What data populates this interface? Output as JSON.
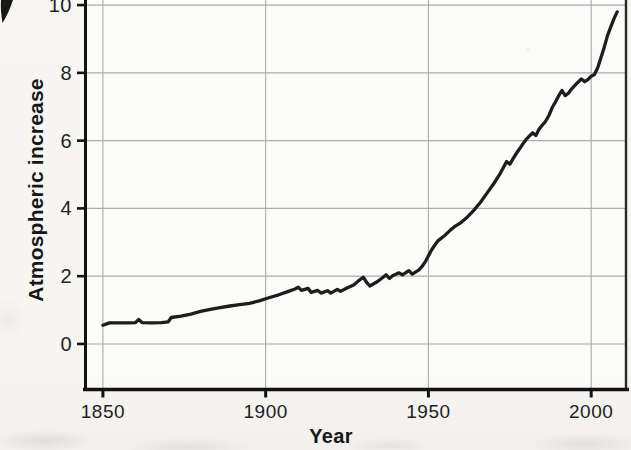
{
  "figure": {
    "background": "#f6f5f2",
    "line_color": "#1d1d1d",
    "grid_color": "#ababab",
    "axis_color": "#131313"
  },
  "chart_data": {
    "type": "line",
    "title": "",
    "xlabel": "Year",
    "ylabel": "Atmospheric increase",
    "x_ticks": [
      1850,
      1900,
      1950,
      2000
    ],
    "y_ticks": [
      0,
      2,
      4,
      6,
      8,
      10
    ],
    "xlim": [
      1844.5,
      2011
    ],
    "ylim": [
      -1.33,
      10.15
    ],
    "grid": true,
    "legend": "none",
    "series": [
      {
        "name": "atmospheric-increase",
        "points": [
          [
            1850,
            0.55
          ],
          [
            1852,
            0.62
          ],
          [
            1855,
            0.62
          ],
          [
            1858,
            0.62
          ],
          [
            1860,
            0.63
          ],
          [
            1861,
            0.72
          ],
          [
            1862,
            0.63
          ],
          [
            1865,
            0.62
          ],
          [
            1868,
            0.63
          ],
          [
            1870,
            0.65
          ],
          [
            1871,
            0.78
          ],
          [
            1874,
            0.82
          ],
          [
            1877,
            0.88
          ],
          [
            1880,
            0.96
          ],
          [
            1883,
            1.02
          ],
          [
            1886,
            1.07
          ],
          [
            1889,
            1.12
          ],
          [
            1892,
            1.16
          ],
          [
            1895,
            1.2
          ],
          [
            1898,
            1.27
          ],
          [
            1901,
            1.36
          ],
          [
            1904,
            1.45
          ],
          [
            1907,
            1.55
          ],
          [
            1909,
            1.62
          ],
          [
            1910,
            1.67
          ],
          [
            1911,
            1.58
          ],
          [
            1913,
            1.64
          ],
          [
            1914,
            1.52
          ],
          [
            1916,
            1.58
          ],
          [
            1917,
            1.5
          ],
          [
            1919,
            1.57
          ],
          [
            1920,
            1.5
          ],
          [
            1922,
            1.61
          ],
          [
            1923,
            1.55
          ],
          [
            1925,
            1.65
          ],
          [
            1927,
            1.74
          ],
          [
            1929,
            1.9
          ],
          [
            1930,
            1.97
          ],
          [
            1931,
            1.82
          ],
          [
            1932,
            1.71
          ],
          [
            1934,
            1.82
          ],
          [
            1936,
            1.96
          ],
          [
            1937,
            2.04
          ],
          [
            1938,
            1.93
          ],
          [
            1939,
            2.01
          ],
          [
            1941,
            2.1
          ],
          [
            1942,
            2.04
          ],
          [
            1944,
            2.16
          ],
          [
            1945,
            2.06
          ],
          [
            1947,
            2.18
          ],
          [
            1948,
            2.28
          ],
          [
            1949,
            2.42
          ],
          [
            1950,
            2.6
          ],
          [
            1951,
            2.78
          ],
          [
            1952,
            2.92
          ],
          [
            1953,
            3.05
          ],
          [
            1955,
            3.2
          ],
          [
            1957,
            3.38
          ],
          [
            1958,
            3.46
          ],
          [
            1960,
            3.58
          ],
          [
            1962,
            3.75
          ],
          [
            1964,
            3.95
          ],
          [
            1966,
            4.18
          ],
          [
            1968,
            4.45
          ],
          [
            1970,
            4.72
          ],
          [
            1972,
            5.02
          ],
          [
            1974,
            5.38
          ],
          [
            1975,
            5.3
          ],
          [
            1976,
            5.47
          ],
          [
            1977,
            5.62
          ],
          [
            1978,
            5.76
          ],
          [
            1979,
            5.9
          ],
          [
            1980,
            6.03
          ],
          [
            1981,
            6.13
          ],
          [
            1982,
            6.23
          ],
          [
            1983,
            6.15
          ],
          [
            1984,
            6.34
          ],
          [
            1985,
            6.46
          ],
          [
            1986,
            6.57
          ],
          [
            1987,
            6.74
          ],
          [
            1988,
            6.97
          ],
          [
            1989,
            7.14
          ],
          [
            1990,
            7.32
          ],
          [
            1991,
            7.48
          ],
          [
            1992,
            7.33
          ],
          [
            1993,
            7.4
          ],
          [
            1994,
            7.53
          ],
          [
            1995,
            7.63
          ],
          [
            1996,
            7.73
          ],
          [
            1997,
            7.82
          ],
          [
            1998,
            7.74
          ],
          [
            1999,
            7.8
          ],
          [
            2000,
            7.9
          ],
          [
            2001,
            7.95
          ],
          [
            2002,
            8.15
          ],
          [
            2003,
            8.45
          ],
          [
            2004,
            8.75
          ],
          [
            2005,
            9.1
          ],
          [
            2006,
            9.35
          ],
          [
            2007,
            9.6
          ],
          [
            2008,
            9.8
          ]
        ]
      }
    ],
    "layout": {
      "plot_left_px": 85,
      "plot_right_px": 627,
      "plot_top_px": 0,
      "plot_bottom_px": 389
    }
  }
}
